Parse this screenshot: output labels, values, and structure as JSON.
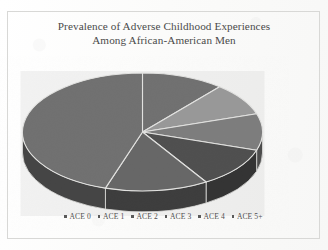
{
  "figure": {
    "title_line_1": "Prevalence of Adverse Childhood Experiences",
    "title_line_2": "Among African-American Men",
    "frame_color": "#d8d8d6",
    "background_color": "#fdfdfc",
    "text_color": "#4a4a4a"
  },
  "legend": {
    "position": "bottom",
    "marker_shape": "square-dot",
    "marker_color": "#5a5a5a",
    "items": [
      {
        "label": "ACE 0",
        "color": "#6e6e6e"
      },
      {
        "label": "ACE 1",
        "color": "#646464"
      },
      {
        "label": "ACE 2",
        "color": "#585858"
      },
      {
        "label": "ACE 3",
        "color": "#4a4a4a"
      },
      {
        "label": "ACE 4",
        "color": "#9a9a9a"
      },
      {
        "label": "ACE 5+",
        "color": "#7c7c7c"
      }
    ]
  },
  "chart_data": {
    "type": "pie",
    "title": "Prevalence of Adverse Childhood Experiences Among African-American Men",
    "xlabel": "",
    "ylabel": "",
    "style": "3d",
    "start_angle_deg": 0,
    "direction": "clockwise",
    "labels": [
      "ACE 0",
      "ACE 1",
      "ACE 2",
      "ACE 3",
      "ACE 4",
      "ACE 5+"
    ],
    "values": [
      11,
      9,
      10,
      11,
      14,
      45
    ],
    "units": "percent",
    "slices": [
      {
        "label": "ACE 0",
        "value": 11,
        "color": "#6e6e6e",
        "start_deg": 0,
        "end_deg": 40
      },
      {
        "label": "ACE 1",
        "value": 9,
        "color": "#9a9a9a",
        "start_deg": 40,
        "end_deg": 72
      },
      {
        "label": "ACE 2",
        "value": 10,
        "color": "#7c7c7c",
        "start_deg": 72,
        "end_deg": 108
      },
      {
        "label": "ACE 3",
        "value": 11,
        "color": "#4a4a4a",
        "start_deg": 108,
        "end_deg": 148
      },
      {
        "label": "ACE 4",
        "value": 14,
        "color": "#636363",
        "start_deg": 148,
        "end_deg": 198
      },
      {
        "label": "ACE 5+",
        "value": 45,
        "color": "#6e6e6e",
        "start_deg": 198,
        "end_deg": 360
      }
    ],
    "legend": [
      "ACE 0",
      "ACE 1",
      "ACE 2",
      "ACE 3",
      "ACE 4",
      "ACE 5+"
    ],
    "grid": false
  }
}
